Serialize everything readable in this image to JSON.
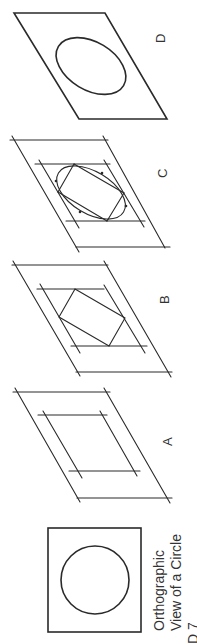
{
  "figure": {
    "orientation": "rotated 90 degrees counter-clockwise",
    "panels": [
      {
        "id": "D",
        "label": "D",
        "description": "Completed isometric ellipse in rhombus"
      },
      {
        "id": "C",
        "label": "C",
        "description": "Arcs drawn between tangent points to form ellipse"
      },
      {
        "id": "B",
        "label": "B",
        "description": "Construction lines connecting midpoints"
      },
      {
        "id": "A",
        "label": "A",
        "description": "Isometric rhombus with centerline offsets"
      }
    ],
    "orthographic": {
      "caption_line1": "Orthographic",
      "caption_line2": "View of a Circle"
    },
    "fragment_text": "D 7"
  },
  "colors": {
    "line": "#2a2a2a",
    "text": "#333333",
    "background": "#ffffff"
  }
}
